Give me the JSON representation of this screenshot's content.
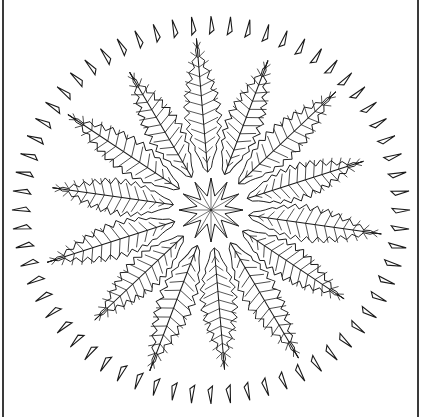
{
  "artwork": {
    "subject": "fern leaf mandala line art",
    "center": {
      "x": 211,
      "y": 210
    },
    "line_color": "#1a1a1a",
    "background": "#ffffff",
    "border_color": "#3a3a3a",
    "outer_ring": {
      "count": 64,
      "radius_x": 190,
      "radius_y": 185,
      "shape": "thin-triangle"
    },
    "leaf_ring": {
      "count": 14,
      "inner_radius": 38,
      "outer_radius": 172,
      "shape": "fern-leaf"
    },
    "center_star": {
      "points": 12,
      "radius": 32
    }
  }
}
